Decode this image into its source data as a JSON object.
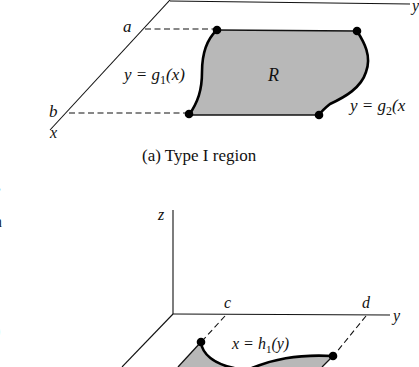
{
  "figure_a": {
    "caption": "(a) Type I region",
    "region_label": "R",
    "bound_low_label": "a",
    "bound_high_label": "b",
    "lower_curve_label": {
      "lhs": "y = g",
      "sub": "1",
      "rhs": "(x)"
    },
    "upper_curve_label": {
      "lhs": "y = g",
      "sub": "2",
      "rhs": "(x"
    },
    "axis_labels": {
      "x": "x",
      "y": "y"
    },
    "colors": {
      "region_fill": "#b8b8b8",
      "curve": "#000000"
    }
  },
  "figure_b": {
    "axis_labels": {
      "x": "x",
      "y": "y",
      "z": "z"
    },
    "bound_low_label": "c",
    "bound_high_label": "d",
    "curve_label": {
      "lhs": "x = h",
      "sub": "1",
      "rhs": "(y)"
    },
    "colors": {
      "region_fill": "#b8b8b8",
      "curve": "#000000"
    }
  },
  "page_fragments": {
    "left_edge": [
      ",",
      "n",
      ")"
    ]
  }
}
